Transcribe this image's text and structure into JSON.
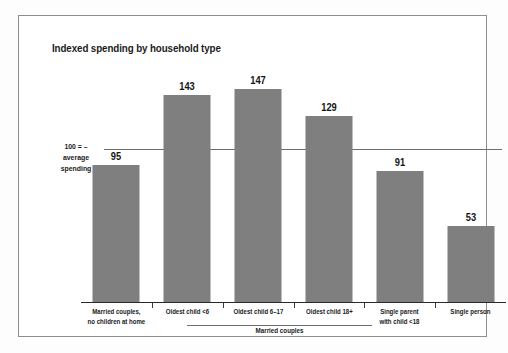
{
  "figure": {
    "title": "Indexed spending by household type",
    "baseline_annotation": {
      "line1": "100 = –",
      "line2": "average",
      "line3": "spending"
    },
    "group_bracket_label": "Married couples",
    "bar_color": "#7f7f80",
    "axis_color": "#2a2a2a",
    "reference_line_color": "#6e6e6e",
    "frame_color": "#8d8d8d"
  },
  "chart_data": {
    "type": "bar",
    "title": "Indexed spending by household type",
    "xlabel": "",
    "ylabel": "",
    "ylim": [
      0,
      170
    ],
    "grid": false,
    "legend": "none",
    "reference_line": {
      "value": 100,
      "label": "100 = average spending"
    },
    "categories": [
      "Married couples, no children at home",
      "Oldest child <6",
      "Oldest child 6–17",
      "Oldest child 18+",
      "Single parent with child <18",
      "Single person"
    ],
    "category_lines": [
      [
        "Married couples,",
        "no children at home"
      ],
      [
        "Oldest child <6"
      ],
      [
        "Oldest child 6–17"
      ],
      [
        "Oldest child 18+"
      ],
      [
        "Single parent",
        "with child <18"
      ],
      [
        "Single person"
      ]
    ],
    "values": [
      95,
      143,
      147,
      129,
      91,
      53
    ],
    "value_labels": [
      "95",
      "143",
      "147",
      "129",
      "91",
      "53"
    ],
    "groups": [
      {
        "label": "Married couples",
        "category_indices": [
          1,
          2,
          3
        ]
      }
    ]
  }
}
